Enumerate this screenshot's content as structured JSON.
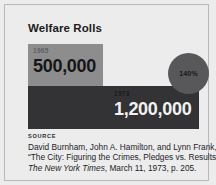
{
  "figure": {
    "title": "Welfare Rolls",
    "badge": {
      "label": "140%",
      "color": "#58585a"
    },
    "bars": [
      {
        "year": "1965",
        "value_label": "500,000",
        "color": "#8d8d8e"
      },
      {
        "year": "1973",
        "value_label": "1,200,000",
        "color": "#333335"
      }
    ],
    "source": {
      "heading": "SOURCE",
      "line1": "David Burnham, John A. Hamilton, and Lynn Frank,",
      "line2": "“The City: Figuring the Crimes, Pledges vs. Results,",
      "line3_italic": "The New York Times",
      "line3_rest": ", March 11, 1973, p. 205."
    }
  },
  "chart_data": {
    "type": "bar",
    "title": "Welfare Rolls",
    "categories": [
      "1965",
      "1973"
    ],
    "values": [
      500000,
      1200000
    ],
    "value_labels": [
      "500,000",
      "1,200,000"
    ],
    "annotations": [
      "140%"
    ],
    "xlabel": "",
    "ylabel": "",
    "grid": false,
    "legend": "none",
    "orientation": "horizontal"
  }
}
